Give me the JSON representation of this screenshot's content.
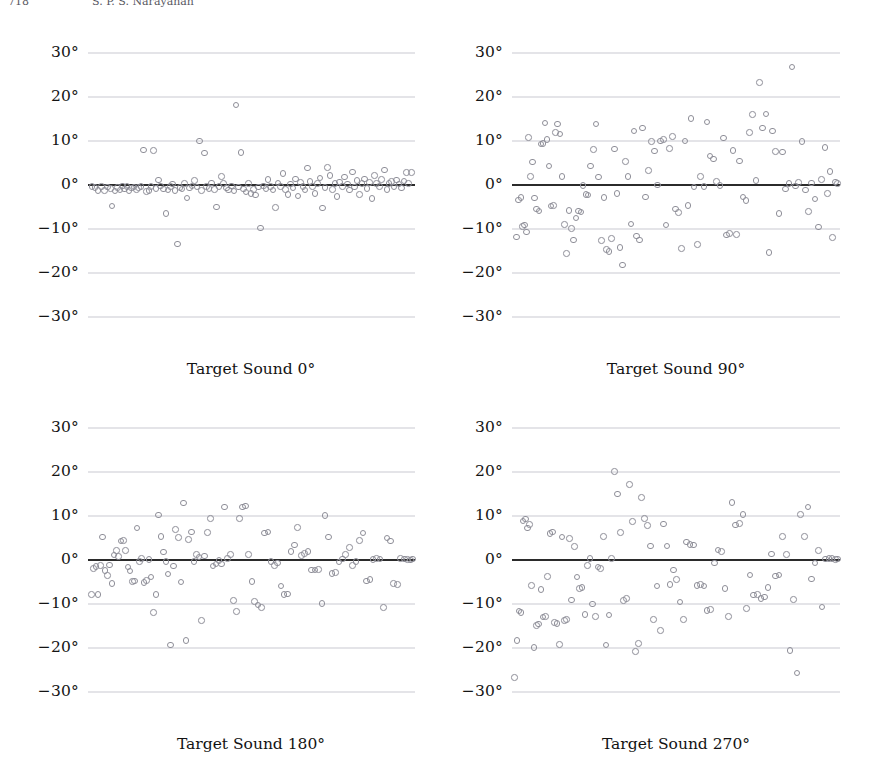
{
  "header": {
    "left_text": "718",
    "right_text": "S. P. S. Narayanan"
  },
  "figure": {
    "yticks": [
      "30°",
      "20°",
      "10°",
      "0°",
      "−10°",
      "−20°",
      "−30°"
    ],
    "marker_color": "#8e8e98",
    "gridline_color": "#c9c9d2",
    "zeroline_color": "#2b2b2b"
  },
  "panels": [
    {
      "caption": "Target Sound 0°"
    },
    {
      "caption": "Target Sound 90°"
    },
    {
      "caption": "Target Sound 180°"
    },
    {
      "caption": "Target Sound 270°"
    }
  ],
  "chart_data": {
    "type": "scatter",
    "title": "",
    "xlabel": "",
    "ylabel": "Localization error (degrees)",
    "ylim": [
      -33,
      33
    ],
    "yticks": [
      30,
      20,
      10,
      0,
      -10,
      -20,
      -30
    ],
    "ytick_labels": [
      "30°",
      "20°",
      "10°",
      "0°",
      "−10°",
      "−20°",
      "−30°"
    ],
    "grid": true,
    "legend": false,
    "reference_line_y": 0,
    "xlim": [
      0,
      1
    ],
    "xaxis_visible": false,
    "panels": [
      {
        "label": "Target Sound 0°",
        "x": [
          0.012,
          0.022,
          0.031,
          0.041,
          0.05,
          0.059,
          0.068,
          0.074,
          0.082,
          0.09,
          0.098,
          0.105,
          0.112,
          0.119,
          0.126,
          0.133,
          0.141,
          0.148,
          0.155,
          0.162,
          0.17,
          0.178,
          0.186,
          0.193,
          0.2,
          0.208,
          0.215,
          0.222,
          0.23,
          0.238,
          0.245,
          0.252,
          0.259,
          0.266,
          0.274,
          0.281,
          0.288,
          0.296,
          0.303,
          0.311,
          0.318,
          0.325,
          0.333,
          0.341,
          0.348,
          0.356,
          0.363,
          0.37,
          0.378,
          0.386,
          0.393,
          0.4,
          0.408,
          0.415,
          0.423,
          0.43,
          0.438,
          0.446,
          0.453,
          0.461,
          0.468,
          0.476,
          0.483,
          0.491,
          0.498,
          0.506,
          0.513,
          0.521,
          0.528,
          0.536,
          0.544,
          0.551,
          0.559,
          0.566,
          0.574,
          0.581,
          0.589,
          0.596,
          0.604,
          0.611,
          0.619,
          0.627,
          0.634,
          0.642,
          0.649,
          0.657,
          0.664,
          0.672,
          0.679,
          0.687,
          0.694,
          0.702,
          0.71,
          0.717,
          0.725,
          0.732,
          0.74,
          0.747,
          0.755,
          0.762,
          0.77,
          0.778,
          0.785,
          0.793,
          0.8,
          0.808,
          0.815,
          0.823,
          0.83,
          0.838,
          0.846,
          0.853,
          0.861,
          0.868,
          0.876,
          0.883,
          0.891,
          0.898,
          0.906,
          0.914,
          0.921,
          0.929,
          0.936,
          0.944,
          0.951,
          0.959,
          0.966,
          0.974,
          0.981,
          0.989
        ],
        "y": [
          -0.4,
          -0.6,
          -1.2,
          -0.3,
          -1.3,
          -0.5,
          -0.8,
          -4.8,
          -1.4,
          -0.6,
          -1.1,
          -0.2,
          -0.9,
          -0.4,
          -1.3,
          -0.7,
          -0.5,
          -1.0,
          -0.6,
          -0.3,
          8.0,
          -1.5,
          -1.2,
          -0.4,
          7.9,
          -0.8,
          1.1,
          -0.2,
          -0.9,
          -6.5,
          -1.1,
          -0.4,
          0.2,
          -1.3,
          -13.4,
          -0.6,
          -0.9,
          0.4,
          -3.0,
          -0.7,
          -0.2,
          1.0,
          -0.5,
          10.0,
          -1.2,
          7.3,
          -0.3,
          -0.8,
          0.5,
          -1.0,
          -5.0,
          -0.4,
          2.0,
          0.3,
          -0.7,
          -1.1,
          -0.2,
          -1.4,
          18.2,
          -0.5,
          7.4,
          -0.9,
          -1.6,
          0.3,
          -2.0,
          -1.0,
          -2.3,
          -0.5,
          -9.8,
          -0.2,
          -0.8,
          1.2,
          -0.4,
          -1.1,
          -5.1,
          0.5,
          -0.3,
          2.6,
          -1.0,
          -2.2,
          0.2,
          -0.7,
          1.4,
          -2.5,
          0.6,
          -0.3,
          -1.1,
          3.9,
          0.8,
          -0.4,
          -2.0,
          0.3,
          1.6,
          -5.2,
          -0.6,
          4.0,
          2.2,
          -1.0,
          0.4,
          -2.6,
          0.7,
          -0.3,
          1.8,
          0.2,
          -1.1,
          3.0,
          -0.5,
          1.0,
          -2.2,
          0.3,
          1.4,
          -0.8,
          0.6,
          -3.1,
          2.1,
          0.4,
          -0.4,
          1.2,
          3.4,
          -1.0,
          0.3,
          0.8,
          -0.5,
          1.1,
          0.2,
          -0.7,
          0.9,
          2.9,
          0.4,
          2.8
        ]
      },
      {
        "label": "Target Sound 90°",
        "x": [
          0.014,
          0.02,
          0.027,
          0.032,
          0.038,
          0.044,
          0.05,
          0.056,
          0.062,
          0.068,
          0.075,
          0.082,
          0.088,
          0.094,
          0.1,
          0.107,
          0.113,
          0.119,
          0.126,
          0.132,
          0.139,
          0.146,
          0.153,
          0.16,
          0.167,
          0.174,
          0.181,
          0.188,
          0.195,
          0.203,
          0.21,
          0.217,
          0.225,
          0.232,
          0.24,
          0.248,
          0.256,
          0.264,
          0.272,
          0.28,
          0.288,
          0.296,
          0.304,
          0.312,
          0.32,
          0.329,
          0.337,
          0.346,
          0.354,
          0.363,
          0.372,
          0.38,
          0.389,
          0.398,
          0.407,
          0.416,
          0.425,
          0.434,
          0.443,
          0.452,
          0.461,
          0.47,
          0.48,
          0.489,
          0.498,
          0.508,
          0.517,
          0.527,
          0.536,
          0.546,
          0.555,
          0.565,
          0.575,
          0.585,
          0.594,
          0.604,
          0.614,
          0.624,
          0.634,
          0.644,
          0.654,
          0.664,
          0.674,
          0.684,
          0.694,
          0.704,
          0.714,
          0.724,
          0.734,
          0.744,
          0.754,
          0.764,
          0.774,
          0.784,
          0.794,
          0.804,
          0.814,
          0.824,
          0.834,
          0.844,
          0.854,
          0.864,
          0.874,
          0.884,
          0.894,
          0.904,
          0.914,
          0.924,
          0.934,
          0.944,
          0.954,
          0.962,
          0.97,
          0.978,
          0.986,
          0.993
        ],
        "y": [
          -11.8,
          -3.4,
          -2.8,
          -9.4,
          -9.1,
          -10.7,
          10.8,
          1.9,
          5.2,
          -3.0,
          -5.5,
          -5.9,
          9.3,
          9.4,
          14.1,
          10.4,
          4.3,
          -4.8,
          -4.6,
          11.9,
          13.9,
          11.6,
          1.9,
          -9.0,
          -15.6,
          -5.8,
          -9.9,
          -12.5,
          -7.5,
          -5.9,
          -6.1,
          -0.1,
          -2.1,
          -2.3,
          4.3,
          8.1,
          13.9,
          1.8,
          -12.6,
          -2.9,
          -14.7,
          -15.2,
          -12.2,
          8.2,
          -1.9,
          -14.2,
          -18.2,
          5.3,
          1.9,
          -8.9,
          12.3,
          -11.6,
          -12.5,
          13.0,
          -2.7,
          3.3,
          9.9,
          7.7,
          0.0,
          10.0,
          10.3,
          -9.1,
          8.3,
          11.0,
          -5.5,
          -6.2,
          -14.5,
          10.0,
          -4.7,
          15.2,
          -0.5,
          -13.5,
          2.0,
          -0.3,
          14.3,
          6.6,
          5.9,
          0.8,
          -0.1,
          10.7,
          -11.4,
          -11.0,
          7.8,
          -11.3,
          5.5,
          -2.7,
          -3.5,
          12.0,
          16.1,
          1.0,
          23.3,
          13.0,
          16.2,
          -15.3,
          12.3,
          7.6,
          -6.5,
          7.5,
          -0.9,
          0.3,
          26.9,
          -0.2,
          0.6,
          9.9,
          -1.1,
          -6.0,
          0.5,
          -3.2,
          -9.6,
          1.2,
          8.5,
          -2.0,
          3.1,
          -12.0,
          0.7,
          0.4
        ]
      },
      {
        "label": "Target Sound 180°",
        "x": [
          0.01,
          0.017,
          0.024,
          0.031,
          0.038,
          0.045,
          0.052,
          0.059,
          0.066,
          0.073,
          0.08,
          0.087,
          0.094,
          0.101,
          0.108,
          0.115,
          0.122,
          0.129,
          0.136,
          0.143,
          0.15,
          0.157,
          0.164,
          0.171,
          0.178,
          0.186,
          0.193,
          0.2,
          0.208,
          0.215,
          0.223,
          0.23,
          0.238,
          0.245,
          0.253,
          0.261,
          0.268,
          0.276,
          0.284,
          0.292,
          0.3,
          0.308,
          0.316,
          0.324,
          0.332,
          0.34,
          0.348,
          0.357,
          0.365,
          0.374,
          0.382,
          0.391,
          0.4,
          0.409,
          0.418,
          0.427,
          0.436,
          0.445,
          0.454,
          0.463,
          0.472,
          0.482,
          0.491,
          0.501,
          0.51,
          0.52,
          0.53,
          0.54,
          0.55,
          0.56,
          0.57,
          0.58,
          0.59,
          0.6,
          0.61,
          0.621,
          0.631,
          0.641,
          0.652,
          0.662,
          0.673,
          0.683,
          0.694,
          0.704,
          0.715,
          0.725,
          0.736,
          0.746,
          0.757,
          0.767,
          0.778,
          0.788,
          0.799,
          0.809,
          0.82,
          0.83,
          0.841,
          0.851,
          0.862,
          0.872,
          0.883,
          0.893,
          0.904,
          0.914,
          0.925,
          0.935,
          0.946,
          0.956,
          0.967,
          0.977,
          0.986,
          0.993
        ],
        "y": [
          -7.9,
          -1.9,
          -1.5,
          -7.8,
          -1.2,
          5.2,
          -2.4,
          -3.5,
          -1.1,
          -5.3,
          1.1,
          2.2,
          0.8,
          4.3,
          4.4,
          2.1,
          -1.6,
          -2.5,
          -4.9,
          -4.8,
          7.3,
          -0.4,
          0.3,
          -5.1,
          -4.6,
          0.1,
          -3.9,
          -11.9,
          -7.8,
          10.2,
          5.4,
          1.8,
          -0.3,
          -3.2,
          -19.3,
          -1.4,
          6.9,
          5.1,
          -5.0,
          13.0,
          -18.3,
          4.7,
          6.4,
          -0.4,
          1.2,
          0.7,
          -13.8,
          0.9,
          6.3,
          9.4,
          -1.4,
          -0.9,
          -0.1,
          -0.9,
          12.1,
          0.3,
          1.2,
          -9.2,
          -11.7,
          9.5,
          12.1,
          12.3,
          1.3,
          -4.9,
          -9.5,
          -10.2,
          -10.8,
          6.1,
          6.4,
          -0.4,
          -1.2,
          -0.7,
          -5.9,
          -7.9,
          -7.7,
          1.9,
          3.4,
          7.4,
          1.0,
          1.5,
          1.9,
          -2.3,
          -2.3,
          -2.1,
          -9.9,
          10.1,
          5.2,
          -3.1,
          -2.9,
          -0.5,
          0.2,
          1.2,
          2.9,
          -1.2,
          -0.3,
          4.4,
          6.1,
          -4.8,
          -4.4,
          0.1,
          0.3,
          0.2,
          -10.8,
          5.0,
          4.3,
          -5.3,
          -5.6,
          0.4,
          0.2,
          0.1,
          0.0,
          0.2
        ]
      },
      {
        "label": "Target Sound 270°",
        "x": [
          0.008,
          0.015,
          0.021,
          0.028,
          0.034,
          0.041,
          0.047,
          0.054,
          0.06,
          0.067,
          0.074,
          0.081,
          0.088,
          0.095,
          0.102,
          0.109,
          0.116,
          0.123,
          0.13,
          0.137,
          0.145,
          0.152,
          0.16,
          0.167,
          0.175,
          0.182,
          0.19,
          0.198,
          0.206,
          0.214,
          0.222,
          0.23,
          0.238,
          0.246,
          0.254,
          0.262,
          0.27,
          0.279,
          0.287,
          0.296,
          0.304,
          0.313,
          0.322,
          0.331,
          0.34,
          0.349,
          0.358,
          0.367,
          0.376,
          0.385,
          0.394,
          0.404,
          0.413,
          0.423,
          0.432,
          0.442,
          0.452,
          0.462,
          0.472,
          0.482,
          0.492,
          0.502,
          0.512,
          0.522,
          0.532,
          0.543,
          0.553,
          0.564,
          0.574,
          0.585,
          0.595,
          0.606,
          0.617,
          0.628,
          0.638,
          0.649,
          0.66,
          0.671,
          0.682,
          0.693,
          0.704,
          0.715,
          0.726,
          0.737,
          0.748,
          0.759,
          0.77,
          0.781,
          0.792,
          0.803,
          0.814,
          0.825,
          0.836,
          0.847,
          0.858,
          0.869,
          0.88,
          0.891,
          0.902,
          0.913,
          0.924,
          0.934,
          0.945,
          0.955,
          0.966,
          0.976,
          0.986,
          0.993
        ],
        "y": [
          -26.7,
          -18.3,
          -11.6,
          -11.9,
          8.9,
          9.3,
          7.3,
          8.1,
          -5.8,
          -19.9,
          -14.9,
          -14.6,
          -6.7,
          -13.0,
          -12.8,
          -3.8,
          6.0,
          6.4,
          -14.2,
          -14.5,
          -19.2,
          5.2,
          -13.8,
          -13.5,
          4.9,
          -9.1,
          3.1,
          -3.9,
          -6.5,
          -6.3,
          -12.4,
          -1.3,
          0.3,
          -10.0,
          -12.8,
          -1.6,
          -1.9,
          5.4,
          -19.3,
          -12.5,
          0.3,
          20.1,
          15.0,
          6.3,
          -9.2,
          -8.7,
          17.2,
          8.8,
          -20.8,
          -19.0,
          14.2,
          9.4,
          7.8,
          3.2,
          -13.6,
          -5.9,
          -16.0,
          8.2,
          3.2,
          -5.6,
          -2.3,
          -4.4,
          -9.6,
          -13.6,
          4.1,
          3.5,
          3.4,
          -5.8,
          -5.6,
          -5.9,
          -11.5,
          -11.3,
          -0.7,
          2.3,
          2.0,
          -6.5,
          -12.9,
          13.1,
          8.0,
          8.3,
          10.3,
          -11.1,
          -3.4,
          -8.0,
          -7.9,
          -8.8,
          -8.4,
          -6.2,
          1.4,
          -3.6,
          -3.4,
          5.3,
          1.2,
          -20.6,
          -9.0,
          -25.7,
          10.3,
          5.3,
          12.1,
          -4.3,
          -0.7,
          2.1,
          -10.7,
          0.2,
          0.4,
          0.3,
          0.1,
          0.2
        ]
      }
    ]
  }
}
